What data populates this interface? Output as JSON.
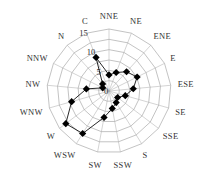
{
  "chart_data": {
    "type": "radar",
    "title": "",
    "directions": [
      "NNE",
      "NE",
      "ENE",
      "E",
      "ESE",
      "SE",
      "SSE",
      "S",
      "SSW",
      "SW",
      "WSW",
      "W",
      "WNW",
      "NW",
      "NNW",
      "N",
      "C"
    ],
    "series": [
      {
        "name": "wind frequency",
        "values": [
          3.9,
          4.8,
          6.3,
          7.6,
          5.9,
          4.1,
          2.6,
          3.3,
          4.3,
          6.5,
          12.1,
          13.1,
          9.4,
          5.5,
          1.7,
          2.3,
          8.7
        ],
        "color": "#000000",
        "marker": "diamond"
      }
    ],
    "radial_axis": {
      "ticks": [
        0,
        5,
        10,
        15
      ],
      "tick_labels": [
        "0",
        "5",
        "10",
        "15"
      ],
      "range": [
        0,
        15
      ]
    },
    "grid": true,
    "legend": null
  },
  "layout": {
    "center": [
      109,
      91
    ],
    "radius": 62
  }
}
